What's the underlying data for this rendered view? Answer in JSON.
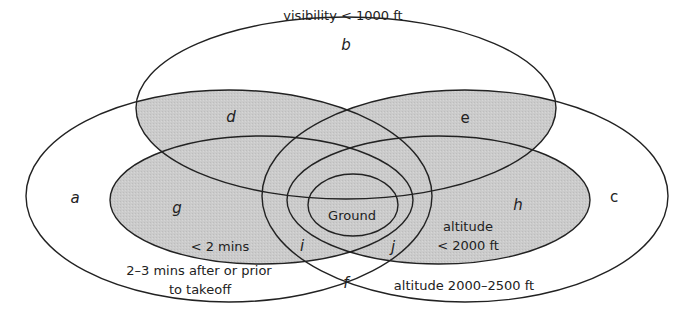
{
  "diagram": {
    "type": "venn",
    "colors": {
      "shade": "#c9c9c9",
      "stroke": "#222222",
      "background": "#ffffff"
    },
    "sets": {
      "visibility": "visibility < 1000 ft",
      "time_outer_line1": "2–3 mins after or prior",
      "time_outer_line2": "to takeoff",
      "time_inner": "< 2 mins",
      "altitude_outer": "altitude 2000–2500 ft",
      "altitude_inner_line1": "altitude",
      "altitude_inner_line2": "< 2000 ft",
      "core": "Ground"
    },
    "regions": {
      "a": "a",
      "b": "b",
      "c": "c",
      "d": "d",
      "e": "e",
      "f": "f",
      "g": "g",
      "h": "h",
      "i": "i",
      "j": "j"
    }
  }
}
